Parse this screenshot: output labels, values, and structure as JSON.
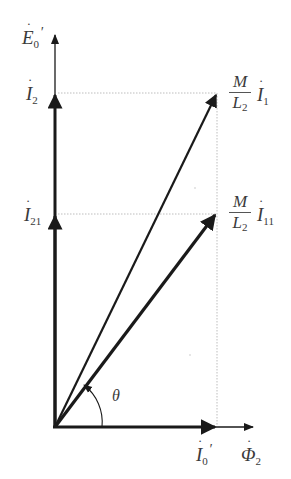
{
  "diagram": {
    "type": "phasor-diagram",
    "colors": {
      "vector": "#1a1a1a",
      "guide": "#bdbdbd",
      "label": "#3a3a3a"
    },
    "origin": [
      55,
      427
    ],
    "labels": {
      "e0_prime": {
        "symbol": "E",
        "sub": "0",
        "prime": "′",
        "dot": "˙"
      },
      "i2": {
        "symbol": "I",
        "sub": "2",
        "dot": "˙"
      },
      "i21": {
        "symbol": "I",
        "sub": "21",
        "dot": "˙"
      },
      "m_l2_i1": {
        "num": "M",
        "den": "L",
        "den_sub": "2",
        "symbol": "I",
        "sub": "1",
        "dot": "˙"
      },
      "m_l2_i11": {
        "num": "M",
        "den": "L",
        "den_sub": "2",
        "symbol": "I",
        "sub": "11",
        "dot": "˙"
      },
      "i0_prime": {
        "symbol": "I",
        "sub": "0",
        "prime": "′",
        "dot": "˙"
      },
      "phi2": {
        "symbol": "Φ",
        "sub": "2",
        "dot": "˙"
      },
      "theta": "θ"
    },
    "vectors": [
      {
        "name": "E0' axis",
        "from": [
          55,
          427
        ],
        "to": [
          55,
          33
        ],
        "weight": "thin"
      },
      {
        "name": "I2",
        "from": [
          55,
          427
        ],
        "to": [
          55,
          93
        ],
        "weight": "thick"
      },
      {
        "name": "I21",
        "from": [
          55,
          427
        ],
        "to": [
          55,
          214
        ],
        "weight": "thick"
      },
      {
        "name": "(M/L2) I1",
        "from": [
          55,
          427
        ],
        "to": [
          217,
          93
        ],
        "weight": "medium"
      },
      {
        "name": "(M/L2) I11",
        "from": [
          55,
          427
        ],
        "to": [
          217,
          214
        ],
        "weight": "thick"
      },
      {
        "name": "I0'",
        "from": [
          55,
          427
        ],
        "to": [
          217,
          427
        ],
        "weight": "thick"
      },
      {
        "name": "Phi2 axis",
        "from": [
          217,
          427
        ],
        "to": [
          255,
          427
        ],
        "weight": "thin"
      }
    ],
    "guides": [
      {
        "from": [
          55,
          93
        ],
        "to": [
          217,
          93
        ]
      },
      {
        "from": [
          55,
          214
        ],
        "to": [
          217,
          214
        ]
      },
      {
        "from": [
          217,
          93
        ],
        "to": [
          217,
          427
        ]
      }
    ]
  }
}
